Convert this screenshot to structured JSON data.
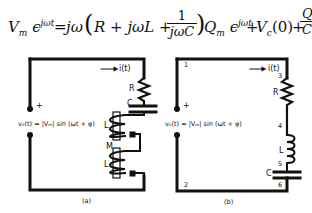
{
  "equation": {
    "lhs": "V",
    "lhs_sub": "m",
    "lhs_exp": "ϵ",
    "lhs_exp_sup": "jωt",
    "equals": "=",
    "jw": "jω",
    "paren_open": "(",
    "R_term": "R + jωL +",
    "frac1_num": "1",
    "frac1_den": "jωC",
    "paren_close": ")",
    "Q_term": "Q",
    "Q_sub": "m",
    "Q_exp": "ϵ",
    "Q_exp_sup": "jωt",
    "plus1": "+",
    "Vc": "V",
    "Vc_sub": "c",
    "Vc_arg": "(0)",
    "plus2": "+",
    "frac2_num": "Q₀",
    "frac2_den": "C"
  },
  "circuit_a": {
    "caption": "(a)",
    "source_label": "v₀(t) = |Vₘ| sin (ωt + φ)",
    "plus_sign": "+",
    "current_label": "i(t)",
    "components": {
      "R": "R",
      "C": "C",
      "L1": "L",
      "M": "M",
      "L2": "L"
    }
  },
  "circuit_b": {
    "caption": "(b)",
    "source_label": "v₀(t) = |Vₘ| sin (ωt + φ)",
    "plus_sign": "+",
    "current_label": "i(t)",
    "components": {
      "R": "R",
      "L": "L",
      "C": "C"
    },
    "nodes": [
      "1",
      "2",
      "3",
      "4",
      "5",
      "6"
    ]
  }
}
